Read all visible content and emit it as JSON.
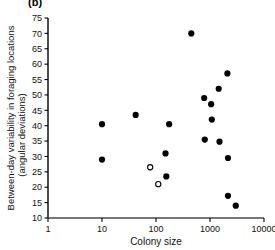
{
  "figure": {
    "panel_label": "(b)",
    "background_color": "#ffffff",
    "axis_color": "#000000",
    "marker_fill_color": "#000000",
    "marker_open_color": "#ffffff"
  },
  "chart_data": {
    "type": "scatter",
    "title": "(b)",
    "xlabel": "Colony size",
    "ylabel": "Between-day variability in foraging locations (angular deviations)",
    "ylabel_line1": "Between-day variability in foraging locations",
    "ylabel_line2": "(angular deviations)",
    "xscale": "log",
    "yscale": "linear",
    "xlim": [
      1,
      10000
    ],
    "ylim": [
      10,
      75
    ],
    "grid": false,
    "legend": false,
    "xticks": [
      1,
      10,
      100,
      1000,
      10000
    ],
    "xtick_labels": [
      "1",
      "10",
      "100",
      "1000",
      "10000"
    ],
    "yticks": [
      10,
      15,
      20,
      25,
      30,
      35,
      40,
      45,
      50,
      55,
      60,
      65,
      70,
      75
    ],
    "ytick_labels": [
      "10",
      "15",
      "20",
      "25",
      "30",
      "35",
      "40",
      "45",
      "50",
      "55",
      "60",
      "65",
      "70",
      "75"
    ],
    "series": [
      {
        "name": "filled-circles",
        "marker": "filled-circle",
        "points": [
          {
            "x": 10,
            "y": 40.5
          },
          {
            "x": 10,
            "y": 29.0
          },
          {
            "x": 42,
            "y": 43.5
          },
          {
            "x": 150,
            "y": 31.0
          },
          {
            "x": 155,
            "y": 23.5
          },
          {
            "x": 175,
            "y": 40.5
          },
          {
            "x": 450,
            "y": 70.0
          },
          {
            "x": 780,
            "y": 49.0
          },
          {
            "x": 800,
            "y": 35.5
          },
          {
            "x": 1050,
            "y": 47.0
          },
          {
            "x": 1080,
            "y": 42.0
          },
          {
            "x": 1450,
            "y": 52.0
          },
          {
            "x": 1500,
            "y": 34.8
          },
          {
            "x": 2100,
            "y": 57.0
          },
          {
            "x": 2150,
            "y": 29.5
          },
          {
            "x": 2150,
            "y": 17.2
          },
          {
            "x": 3000,
            "y": 14.0
          }
        ]
      },
      {
        "name": "open-circles",
        "marker": "open-circle",
        "points": [
          {
            "x": 78,
            "y": 26.5
          },
          {
            "x": 110,
            "y": 21.0
          }
        ]
      }
    ]
  }
}
